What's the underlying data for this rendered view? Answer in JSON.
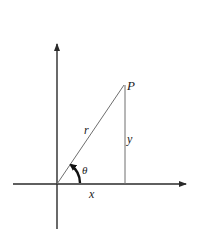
{
  "diagram": {
    "type": "polar-coordinates",
    "labels": {
      "point": "P",
      "radius": "r",
      "vertical": "y",
      "angle": "θ",
      "horizontal": "x"
    },
    "colors": {
      "axis": "#2a2a2a",
      "line": "#6e6e6e",
      "arc": "#111111",
      "text": "#1a1a1a"
    }
  }
}
